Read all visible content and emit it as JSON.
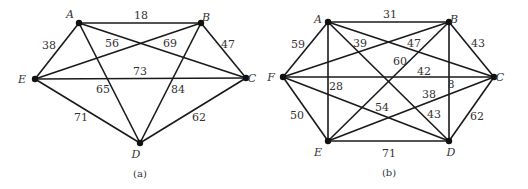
{
  "figure": {
    "graphs": [
      {
        "id": "a",
        "caption": "(a)",
        "nodes": [
          {
            "name": "A",
            "x": 79,
            "y": 23,
            "lx": 70,
            "ly": 18
          },
          {
            "name": "B",
            "x": 201,
            "y": 23,
            "lx": 206,
            "ly": 21
          },
          {
            "name": "C",
            "x": 246,
            "y": 78,
            "lx": 252,
            "ly": 82
          },
          {
            "name": "D",
            "x": 140,
            "y": 143,
            "lx": 136,
            "ly": 158
          },
          {
            "name": "E",
            "x": 35,
            "y": 79,
            "lx": 22,
            "ly": 83
          }
        ],
        "edges": [
          {
            "from": "A",
            "to": "B",
            "weight": "18",
            "lx": 141,
            "ly": 19
          },
          {
            "from": "A",
            "to": "E",
            "weight": "38",
            "lx": 49,
            "ly": 49
          },
          {
            "from": "E",
            "to": "B",
            "weight": "56",
            "lx": 112,
            "ly": 47
          },
          {
            "from": "A",
            "to": "C",
            "weight": "69",
            "lx": 170,
            "ly": 47
          },
          {
            "from": "B",
            "to": "C",
            "weight": "47",
            "lx": 228,
            "ly": 48
          },
          {
            "from": "E",
            "to": "C",
            "weight": "73",
            "lx": 140,
            "ly": 75
          },
          {
            "from": "A",
            "to": "D",
            "weight": "65",
            "lx": 103,
            "ly": 93
          },
          {
            "from": "B",
            "to": "D",
            "weight": "84",
            "lx": 178,
            "ly": 93
          },
          {
            "from": "E",
            "to": "D",
            "weight": "71",
            "lx": 81,
            "ly": 121
          },
          {
            "from": "C",
            "to": "D",
            "weight": "62",
            "lx": 199,
            "ly": 121
          }
        ],
        "caption_pos": {
          "x": 140,
          "y": 177
        }
      },
      {
        "id": "b",
        "caption": "(b)",
        "nodes": [
          {
            "name": "A",
            "x": 328,
            "y": 22,
            "lx": 318,
            "ly": 23
          },
          {
            "name": "B",
            "x": 449,
            "y": 22,
            "lx": 454,
            "ly": 23
          },
          {
            "name": "C",
            "x": 494,
            "y": 77,
            "lx": 500,
            "ly": 81
          },
          {
            "name": "D",
            "x": 449,
            "y": 141,
            "lx": 451,
            "ly": 156
          },
          {
            "name": "E",
            "x": 328,
            "y": 141,
            "lx": 318,
            "ly": 156
          },
          {
            "name": "F",
            "x": 283,
            "y": 77,
            "lx": 271,
            "ly": 81
          }
        ],
        "edges": [
          {
            "from": "A",
            "to": "B",
            "weight": "31",
            "lx": 390,
            "ly": 18
          },
          {
            "from": "F",
            "to": "A",
            "weight": "59",
            "lx": 298,
            "ly": 48
          },
          {
            "from": "A",
            "to": "C",
            "weight": "39",
            "lx": 360,
            "ly": 47
          },
          {
            "from": "F",
            "to": "B",
            "weight": "47",
            "lx": 414,
            "ly": 47
          },
          {
            "from": "B",
            "to": "C",
            "weight": "43",
            "lx": 478,
            "ly": 47
          },
          {
            "from": "E",
            "to": "B",
            "weight": "60",
            "lx": 400,
            "ly": 65
          },
          {
            "from": "F",
            "to": "C",
            "weight": "42",
            "lx": 424,
            "ly": 75
          },
          {
            "from": "A",
            "to": "E",
            "weight": "28",
            "lx": 336,
            "ly": 90
          },
          {
            "from": "B",
            "to": "D",
            "weight": "8",
            "lx": 451,
            "ly": 88
          },
          {
            "from": "E",
            "to": "C",
            "weight": "38",
            "lx": 429,
            "ly": 98
          },
          {
            "from": "F",
            "to": "D",
            "weight": "54",
            "lx": 382,
            "ly": 111
          },
          {
            "from": "A",
            "to": "D",
            "weight": "43",
            "lx": 434,
            "ly": 118
          },
          {
            "from": "F",
            "to": "E",
            "weight": "50",
            "lx": 297,
            "ly": 119
          },
          {
            "from": "C",
            "to": "D",
            "weight": "62",
            "lx": 477,
            "ly": 120
          },
          {
            "from": "E",
            "to": "D",
            "weight": "71",
            "lx": 389,
            "ly": 157
          }
        ],
        "caption_pos": {
          "x": 389,
          "y": 176
        }
      }
    ]
  }
}
